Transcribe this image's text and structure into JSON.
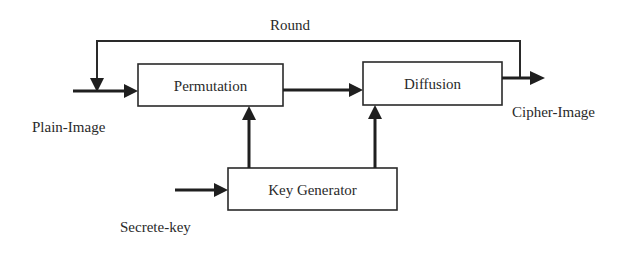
{
  "diagram": {
    "loop_label": "Round",
    "blocks": {
      "permutation": "Permutation",
      "diffusion": "Diffusion",
      "key_generator": "Key Generator"
    },
    "inputs": {
      "plain_image": "Plain-Image",
      "secret_key": "Secrete-key"
    },
    "outputs": {
      "cipher_image": "Cipher-Image"
    },
    "edges": [
      {
        "from": "Plain-Image",
        "to": "Permutation"
      },
      {
        "from": "Permutation",
        "to": "Diffusion"
      },
      {
        "from": "Diffusion",
        "to": "Cipher-Image"
      },
      {
        "from": "Diffusion",
        "to": "Permutation",
        "label": "Round"
      },
      {
        "from": "Secrete-key",
        "to": "Key Generator"
      },
      {
        "from": "Key Generator",
        "to": "Permutation"
      },
      {
        "from": "Key Generator",
        "to": "Diffusion"
      }
    ]
  }
}
